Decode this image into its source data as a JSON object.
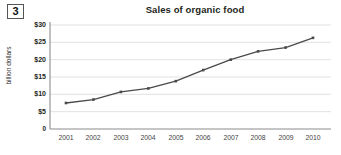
{
  "figure": {
    "number": "3",
    "title": "Sales of organic food"
  },
  "chart_data": {
    "type": "line",
    "title": "Sales of organic food",
    "xlabel": "",
    "ylabel": "billion dollars",
    "categories": [
      "2001",
      "2002",
      "2003",
      "2004",
      "2005",
      "2006",
      "2007",
      "2008",
      "2009",
      "2010"
    ],
    "values": [
      7.5,
      8.5,
      10.7,
      11.7,
      13.8,
      17.0,
      20.0,
      22.4,
      23.5,
      26.3
    ],
    "ylim": [
      0,
      30
    ],
    "yticks": [
      0,
      5,
      10,
      15,
      20,
      25,
      30
    ],
    "ytick_labels": [
      "0",
      "$5",
      "$10",
      "$15",
      "$20",
      "$25",
      "$30"
    ],
    "grid": true,
    "legend": false,
    "marker": "square",
    "line_color": "#4a4a4a",
    "grid_color": "#d9d9d9",
    "axis_color": "#8c8c8c"
  }
}
